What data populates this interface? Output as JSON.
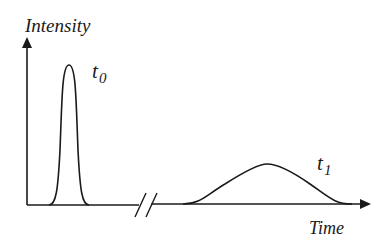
{
  "diagram": {
    "y_axis_label": "Intensity",
    "x_axis_label": "Time",
    "pulse_labels": {
      "t0": {
        "base": "t",
        "sub": "0"
      },
      "t1": {
        "base": "t",
        "sub": "1"
      }
    },
    "axis_break": "//",
    "colors": {
      "stroke": "#1a1a1a",
      "background": "#ffffff"
    }
  }
}
